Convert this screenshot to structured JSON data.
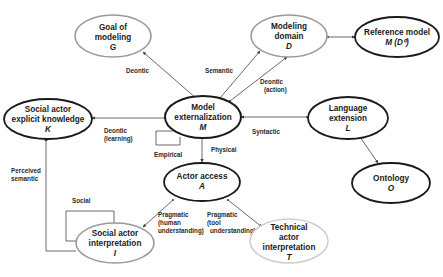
{
  "diagram": {
    "colors": {
      "dark_border": "#1a1a1a",
      "gray_border": "#9a9a9a",
      "light_border": "#c8c8c8",
      "edge": "#444444",
      "text": "#1a1a1a"
    },
    "nodes": {
      "G": {
        "line1": "Goal of",
        "line2": "modeling",
        "symbol": "G",
        "border": "gray"
      },
      "D": {
        "line1": "Modeling",
        "line2": "domain",
        "symbol": "D",
        "border": "gray"
      },
      "R": {
        "line1": "Reference model",
        "symbol": "M (D⁰)",
        "border": "dark"
      },
      "K": {
        "line1": "Social actor",
        "line2": "explicit knowledge",
        "symbol": "K",
        "border": "dark"
      },
      "M": {
        "line1": "Model",
        "line2": "externalization",
        "symbol": "M",
        "border": "dark"
      },
      "L": {
        "line1": "Language",
        "line2": "extension",
        "symbol": "L",
        "border": "dark"
      },
      "A": {
        "line1": "Actor access",
        "symbol": "A",
        "border": "dark"
      },
      "O": {
        "line1": "Ontology",
        "symbol": "O",
        "border": "dark"
      },
      "I": {
        "line1": "Social actor",
        "line2": "interpretation",
        "symbol": "I",
        "border": "gray"
      },
      "T": {
        "line1": "Technical",
        "line2": "actor",
        "line3": "interpretation",
        "symbol": "T",
        "border": "light"
      }
    },
    "edges": {
      "deontic": "Deontic",
      "semantic": "Semantic",
      "deontic_action_1": "Deontic",
      "deontic_action_2": "(action)",
      "deontic_learning_1": "Deontic",
      "deontic_learning_2": "(learning)",
      "syntactic": "Syntactic",
      "empirical": "Empirical",
      "physical": "Physical",
      "perceived_semantic_1": "Perceived",
      "perceived_semantic_2": "semantic",
      "social": "Social",
      "pragmatic_human_1": "Pragmatic",
      "pragmatic_human_2": "(human",
      "pragmatic_human_3": "understanding)",
      "pragmatic_tool_1": "Pragmatic",
      "pragmatic_tool_2": "(tool",
      "pragmatic_tool_3": "understanding)"
    }
  }
}
